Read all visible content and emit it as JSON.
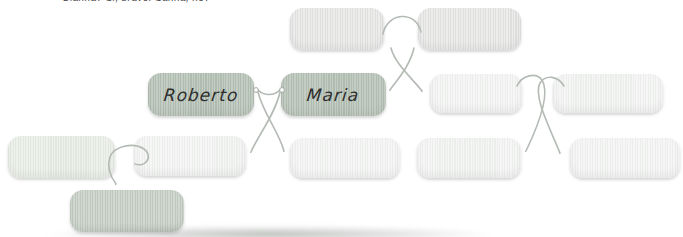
{
  "page": {
    "caption_fragment": "Gianna? Si, bravo! Sanna, no?"
  },
  "family_tree": {
    "type": "family-tree-diagram",
    "string_color": "#b2b8b2",
    "tag_colors": {
      "gray": "#e5e6e5",
      "green": "#bac4ba",
      "pale": "#f0f2f0",
      "pale_green": "#e8eee6",
      "green_light": "#c7d0c7"
    },
    "nodes": [
      {
        "id": "grandparent-left",
        "label": "",
        "style": "gray"
      },
      {
        "id": "grandparent-right",
        "label": "",
        "style": "gray"
      },
      {
        "id": "roberto",
        "label": "Roberto",
        "style": "green"
      },
      {
        "id": "maria",
        "label": "Maria",
        "style": "green"
      },
      {
        "id": "uncle",
        "label": "",
        "style": "pale"
      },
      {
        "id": "aunt",
        "label": "",
        "style": "pale"
      },
      {
        "id": "spouse-left",
        "label": "",
        "style": "pale_green"
      },
      {
        "id": "child-1",
        "label": "",
        "style": "pale"
      },
      {
        "id": "child-2",
        "label": "",
        "style": "pale"
      },
      {
        "id": "cousin-1",
        "label": "",
        "style": "pale"
      },
      {
        "id": "cousin-2",
        "label": "",
        "style": "pale"
      },
      {
        "id": "grandchild",
        "label": "",
        "style": "green_light"
      }
    ]
  }
}
